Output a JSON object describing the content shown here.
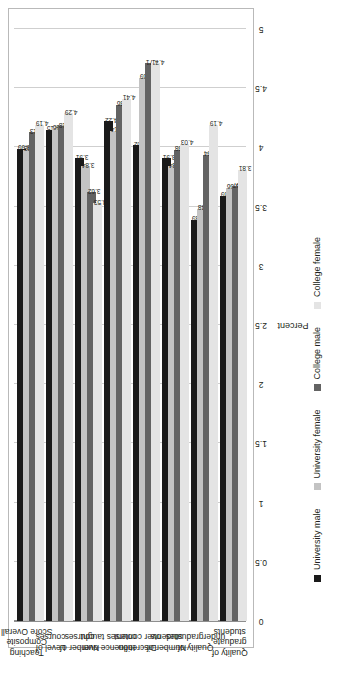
{
  "chart_data": {
    "type": "bar",
    "orientation": "horizontal",
    "title": "",
    "xlabel": "",
    "ylabel": "Percent",
    "axis_title": "Percent",
    "ylim": [
      0,
      5
    ],
    "axis_ticks": [
      "0",
      "0.5",
      "1",
      "1.5",
      "2",
      "2.5",
      "3",
      "3.5",
      "4",
      "4.5",
      "5"
    ],
    "axis_tick_values": [
      0,
      0.5,
      1,
      1.5,
      2,
      2.5,
      3,
      3.5,
      4,
      4.5,
      5
    ],
    "grid": true,
    "legend_position": "bottom",
    "categories": [
      "Teaching Composite Score Overall",
      "Level of courses",
      "Number of courses",
      "Influence over courses taught",
      "Discretion over content",
      "Number of students",
      "Quality of undergraduates",
      "Quality of graduate students"
    ],
    "category_lines": [
      [
        "Teaching",
        "Composite",
        "Score Overall"
      ],
      [
        "Level of",
        "courses"
      ],
      [
        "Number of",
        "courses"
      ],
      [
        "Influence over",
        "courses taught"
      ],
      [
        "Discretion",
        "over content"
      ],
      [
        "Number of",
        "students"
      ],
      [
        "Quality of",
        "undergraduates"
      ],
      [
        "Quality of",
        "graduate",
        "students"
      ]
    ],
    "series": [
      {
        "name": "University male",
        "color": "#1a1a1a",
        "values": [
          3.99,
          4.15,
          3.91,
          4.22,
          4.02,
          3.91,
          3.39,
          3.59
        ],
        "labels": [
          "3.99",
          "4.15",
          "3.91",
          "4.22",
          "4.02",
          "3.91",
          "3.39",
          "3.59"
        ]
      },
      {
        "name": "University female",
        "color": "#c3c3c3",
        "values": [
          3.98,
          4.16,
          3.84,
          4.14,
          4.59,
          3.84,
          3.48,
          3.66
        ],
        "labels": [
          "3.98",
          "4.16",
          "3.84",
          "4.14",
          "4.59",
          "3.84",
          "3.48",
          "3.66"
        ]
      },
      {
        "name": "College male",
        "color": "#636363",
        "values": [
          4.13,
          4.18,
          3.62,
          4.36,
          4.71,
          3.98,
          3.94,
          3.67
        ],
        "labels": [
          "4.13",
          "4.18",
          "3.62",
          "4.36",
          "4.71",
          "3.98",
          "3.94",
          "3.67"
        ]
      },
      {
        "name": "College female",
        "color": "#e4e4e4",
        "values": [
          4.19,
          4.29,
          3.53,
          4.41,
          4.71,
          4.03,
          4.19,
          3.81
        ],
        "labels": [
          "4.19",
          "4.29",
          "3.53",
          "4.41",
          "4.71",
          "4.03",
          "4.19",
          "3.81"
        ]
      }
    ],
    "legend": [
      "University male",
      "University female",
      "College male",
      "College female"
    ]
  }
}
